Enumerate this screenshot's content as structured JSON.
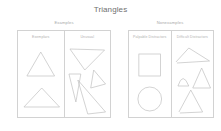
{
  "title": "Triangles",
  "panels": [
    {
      "header": "Examples",
      "subcolumns": [
        {
          "label": "Exemplars",
          "shapes": [
            "equilateral-triangle",
            "wide-flat-triangle"
          ]
        },
        {
          "label": "Unusual",
          "shapes": [
            "inverted-triangle",
            "narrow-sliver-triangle",
            "rotated-scalene-triangle",
            "thin-wedge-triangle"
          ]
        }
      ]
    },
    {
      "header": "Nonexamples",
      "subcolumns": [
        {
          "label": "Palpable Distractors",
          "shapes": [
            "square",
            "circle"
          ]
        },
        {
          "label": "Difficult Distractors",
          "shapes": [
            "obtuse-open-triangle",
            "curved-side-triangle",
            "tall-triangle",
            "open-base-triangle"
          ]
        }
      ]
    }
  ],
  "colors": {
    "stroke": "#c0c0c0",
    "border": "#d2d2d2",
    "title_text": "#6f6f6f",
    "label_text": "#b0b0b0",
    "background": "#ffffff"
  }
}
